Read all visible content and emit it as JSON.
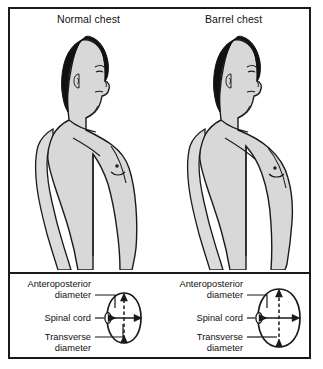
{
  "figure": {
    "panels": [
      {
        "id": "normal",
        "title": "Normal chest",
        "cross_section": {
          "shape": "narrow-oval",
          "labels": {
            "anteroposterior_line1": "Anteroposterior",
            "anteroposterior_line2": "diameter",
            "spinal_cord": "Spinal cord",
            "transverse_line1": "Transverse",
            "transverse_line2": "diameter"
          }
        }
      },
      {
        "id": "barrel",
        "title": "Barrel chest",
        "cross_section": {
          "shape": "rounded-oval",
          "labels": {
            "anteroposterior_line1": "Anteroposterior",
            "anteroposterior_line2": "diameter",
            "spinal_cord": "Spinal cord",
            "transverse_line1": "Transverse",
            "transverse_line2": "diameter"
          }
        }
      }
    ],
    "colors": {
      "outline": "#1a1a1a",
      "hair": "#111111",
      "skin": "#d8d8d8",
      "skin_light": "#e6e6e6",
      "frame": "#1a1a1a",
      "background": "#ffffff"
    }
  }
}
